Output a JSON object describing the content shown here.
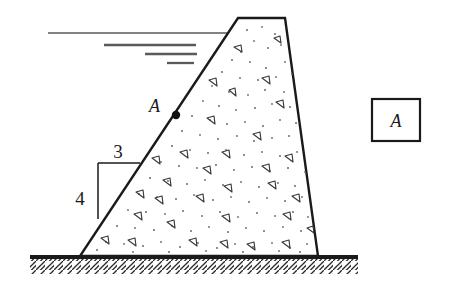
{
  "figure": {
    "background_color": "#ffffff",
    "line_color": "#1a1a1a",
    "fill_color": "#ffffff",
    "water_line_color": "#555555"
  },
  "dam": {
    "name": "concrete-gravity-dam",
    "outline_points": "238,18 285,18 318,256 80,256",
    "crest": {
      "left_x": 238,
      "right_x": 285,
      "y": 18
    },
    "base": {
      "left_x": 80,
      "right_x": 318,
      "y": 256
    },
    "upstream_face_note": "sloping left face",
    "downstream_face_note": "near-vertical right face",
    "texture": "concrete-aggregate-dots-and-triangles"
  },
  "slope_triangle": {
    "name": "slope-ratio-triangle",
    "vertical_label": "4",
    "horizontal_label": "3",
    "vertical": {
      "x": 98,
      "y_top": 163,
      "y_bottom": 219
    },
    "horizontal": {
      "y": 163,
      "x_left": 98,
      "x_right": 140
    },
    "label_positions": {
      "horizontal_label_xy": [
        118,
        159
      ],
      "vertical_label_xy": [
        79,
        199
      ]
    }
  },
  "point_a": {
    "name": "point-A",
    "label": "A",
    "marker_xy": [
      175,
      114
    ],
    "label_xy": [
      157,
      110
    ]
  },
  "legend": {
    "name": "legend-box",
    "label": "A",
    "box": {
      "x": 372,
      "y": 99,
      "width": 48,
      "height": 42
    }
  },
  "water": {
    "name": "upstream-water-surface",
    "lines": [
      {
        "x1": 48,
        "x2": 236,
        "y": 33,
        "width": 1.3
      },
      {
        "x1": 104,
        "x2": 196,
        "y": 45,
        "width": 2.2
      },
      {
        "x1": 145,
        "x2": 197,
        "y": 54,
        "width": 2.2
      },
      {
        "x1": 167,
        "x2": 194,
        "y": 63,
        "width": 2.2
      }
    ]
  },
  "ground": {
    "name": "ground-line",
    "line": {
      "x1": 30,
      "x2": 358,
      "y": 257,
      "width": 4
    },
    "hatch": {
      "x1": 30,
      "x2": 358,
      "y_top": 259,
      "y_bottom": 274,
      "angle": "forward-slash"
    }
  }
}
